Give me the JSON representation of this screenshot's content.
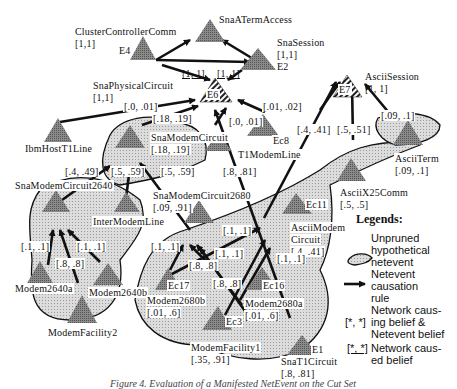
{
  "nodes": {
    "cluster_controller_comm": {
      "name": "ClusterControllerComm",
      "belief": "[1,1]",
      "tag": "E4"
    },
    "sna_aterm_access": {
      "name": "SnaATermAccess"
    },
    "sna_session": {
      "name": "SnaSession",
      "belief": "[1,1]",
      "tag": "E2"
    },
    "sna_physical_circuit": {
      "name": "SnaPhysicalCircuit",
      "belief": "[1,1]"
    },
    "e6": {
      "tag": "E6"
    },
    "ascii_session": {
      "name": "AsciiSession",
      "belief": "[1, 1]",
      "tag": "E7"
    },
    "ibm_host_t1_line": {
      "name": "IbmHostT1Line"
    },
    "sna_modem_circuit": {
      "name": "SnaModemCircuit",
      "belief": "[.18, .19]"
    },
    "t1_modem_line": {
      "name": "T1ModemLine"
    },
    "ec8": {
      "tag": "Ec8"
    },
    "ascii_term": {
      "name": "AsciiTerm",
      "belief": "[.09, .1]"
    },
    "sna_modem_circuit_2640": {
      "name": "SnaModemCircuit2640"
    },
    "inter_modem_line": {
      "name": "InterModemLine"
    },
    "sna_modem_circuit_2680": {
      "name": "SnaModemCircuit2680",
      "belief": "[.09, .91]"
    },
    "ascii_x25_comm": {
      "name": "AsciiX25Comm",
      "belief": "[.5, .5]"
    },
    "ec11": {
      "tag": "Ec11"
    },
    "ascii_modem_circuit": {
      "name_line1": "AsciiModem",
      "name_line2": "Circuit",
      "belief": "[.4, .41]"
    },
    "modem_2640a": {
      "name": "Modem2640a"
    },
    "modem_2640b": {
      "name": "Modem2640b"
    },
    "modem_facility2": {
      "name": "ModemFacility2"
    },
    "ec17": {
      "tag": "Ec17"
    },
    "modem_2680b": {
      "name": "Modem2680b",
      "belief": "[.01, .6]"
    },
    "ec16": {
      "tag": "Ec16"
    },
    "modem_2680a": {
      "name": "Modem2680a",
      "belief": "[.01, .6]"
    },
    "ec3": {
      "tag": "Ec3"
    },
    "modem_facility1": {
      "name": "ModemFacility1",
      "belief": "[.35, .91]"
    },
    "sna_t1_circuit": {
      "name": "SnaT1Circuit",
      "belief": "[.8, .81]",
      "tag": "E1"
    }
  },
  "edge_labels": {
    "e4_e6": "[1, 1]",
    "e2_e6": "[1, 1]",
    "ibm_e6": "[.0, .01]",
    "modem_e6": "[.18, .19]",
    "ec8_e6": "[.01, .02]",
    "t1_e6": "[.0, .01]",
    "ec11_e7": "[.4, .41]",
    "x25_e7": "[.5, .51]",
    "term_e7": "[.09, .1]",
    "t1circ_e6": "[.8, .81]",
    "c2640_mc": "[.4, .49]",
    "iml_mc": "[.5, .59]",
    "c2680_mc": "[.5, .59]",
    "m2640a_c": "[.1, .1]",
    "m2640b_c": "[.1, .1]",
    "mf2_c": "[.8, .8]",
    "ec17_c2680": "[.1, .1]",
    "ec16_c2680": "[.1, .1]",
    "mf1_c2680": "[.8, .8]",
    "mf1_c2680b": "[.8, .8]",
    "ec17_amc": "[.1, .1]",
    "ec16_amc": "[.1, .1]"
  },
  "legend": {
    "title": "Legends:",
    "items": [
      {
        "symbol": "region-shape",
        "text_lines": [
          "Unpruned",
          "hypothetical",
          "netevent"
        ]
      },
      {
        "symbol": "arrow",
        "text_lines": [
          "Netevent",
          "causation",
          "rule"
        ]
      },
      {
        "symbol": "[*, *]",
        "text_lines": [
          "Network caus-",
          "ing belief &",
          "Netevent belief"
        ]
      },
      {
        "symbol": "[*, *]",
        "underlined": true,
        "text_lines": [
          "Network caus-",
          "ed belief"
        ]
      }
    ]
  },
  "caption": "Figure 4. Evaluation of a Manifested NetEvent on the Cut Set",
  "colors": {
    "triangle_fill": "#7a7a7a",
    "region_fill": "#d4d4d4",
    "arrow": "#111111",
    "background": "#ffffff"
  }
}
